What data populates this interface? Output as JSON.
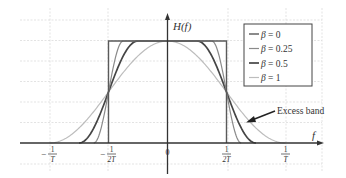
{
  "chart_data": {
    "type": "line",
    "title": "",
    "xlabel": "f",
    "ylabel": "H(f)",
    "x_ticks": [
      {
        "label_num": "1",
        "label_den": "T",
        "sign": "−",
        "value": -1.0
      },
      {
        "label_num": "1",
        "label_den": "2T",
        "sign": "−",
        "value": -0.5
      },
      {
        "label_num": "0",
        "label_den": "",
        "sign": "",
        "value": 0
      },
      {
        "label_num": "1",
        "label_den": "2T",
        "sign": "",
        "value": 0.5
      },
      {
        "label_num": "1",
        "label_den": "T",
        "sign": "",
        "value": 1.0
      }
    ],
    "x_unit": "1/T",
    "ylim": [
      0,
      1
    ],
    "xlim": [
      -1.25,
      1.3
    ],
    "grid": true,
    "legend_position": "upper-right",
    "series": [
      {
        "name": "β = 0",
        "beta": 0,
        "color": "#5a5a5a",
        "width": 1.4
      },
      {
        "name": "β = 0.25",
        "beta": 0.25,
        "color": "#8a8a8a",
        "width": 1.2
      },
      {
        "name": "β = 0.5",
        "beta": 0.5,
        "color": "#454545",
        "width": 1.7
      },
      {
        "name": "β = 1",
        "beta": 1,
        "color": "#bdbdbd",
        "width": 1.2
      }
    ],
    "annotations": [
      {
        "text": "Excess band",
        "arrow_to_x": 0.68,
        "arrow_to_y": 0.22
      }
    ]
  },
  "labels": {
    "y_axis": "H(f)",
    "x_axis": "f",
    "excess_band": "Excess band",
    "legend": [
      "β = 0",
      "β = 0.25",
      "β = 0.5",
      "β = 1"
    ]
  }
}
